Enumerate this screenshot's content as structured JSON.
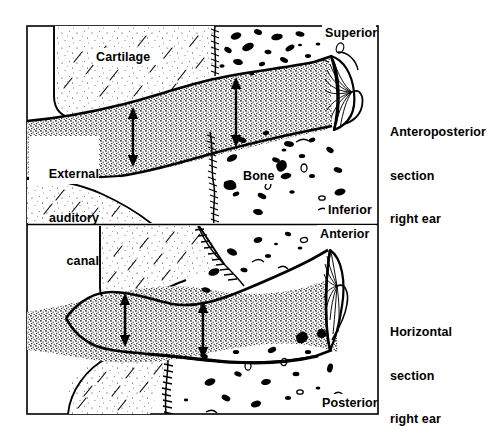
{
  "figure": {
    "panels": [
      {
        "id": "top",
        "caption_lines": [
          "Anteroposterior",
          "section",
          "right ear"
        ],
        "caption_line1": "Anteroposterior",
        "caption_line2": "section",
        "caption_line3": "right ear",
        "orientation_top": "Superior",
        "orientation_bottom": "Inferior",
        "structures": [
          {
            "name": "Cartilage",
            "label": "Cartilage"
          },
          {
            "name": "External auditory canal",
            "label_line1": "External",
            "label_line2": "auditory",
            "label_line3": "canal"
          },
          {
            "name": "Bone",
            "label": "Bone"
          },
          {
            "name": "Tympanic membrane",
            "label": ""
          }
        ]
      },
      {
        "id": "bottom",
        "caption_lines": [
          "Horizontal",
          "section",
          "right ear"
        ],
        "caption_line1": "Horizontal",
        "caption_line2": "section",
        "caption_line3": "right ear",
        "orientation_top": "Anterior",
        "orientation_bottom": "Posterior",
        "structures": [
          {
            "name": "Cartilage",
            "label": ""
          },
          {
            "name": "Bone",
            "label": ""
          },
          {
            "name": "Tympanic membrane",
            "label": ""
          }
        ]
      }
    ],
    "labels": {
      "cartilage": "Cartilage",
      "superior": "Superior",
      "inferior": "Inferior",
      "anterior": "Anterior",
      "posterior": "Posterior",
      "bone": "Bone",
      "external_line1": "External",
      "external_line2": "auditory",
      "external_line3": "canal",
      "ap_line1": "Anteroposterior",
      "ap_line2": "section",
      "ap_line3": "right ear",
      "hz_line1": "Horizontal",
      "hz_line2": "section",
      "hz_line3": "right ear"
    },
    "colors": {
      "ink": "#000000",
      "paper": "#ffffff",
      "stipple": "#1a1a1a"
    },
    "annotations": {
      "arrows": [
        {
          "name": "canal-height-arrow-lateral",
          "panel": "top",
          "type": "double-headed-vertical"
        },
        {
          "name": "canal-height-arrow-medial",
          "panel": "top",
          "type": "double-headed-vertical"
        },
        {
          "name": "canal-width-arrow-lateral",
          "panel": "bottom",
          "type": "double-headed-vertical"
        },
        {
          "name": "canal-width-arrow-medial",
          "panel": "bottom",
          "type": "double-headed-vertical"
        }
      ],
      "suture_line": "bony-cartilaginous junction"
    }
  }
}
